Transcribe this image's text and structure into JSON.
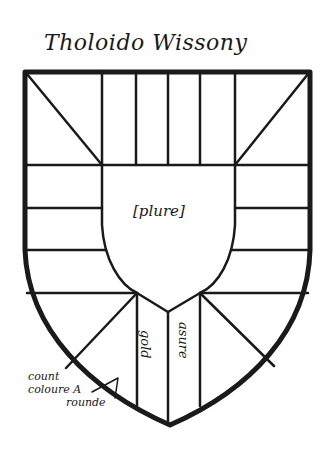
{
  "title": "Tholoido Wissony",
  "shield": {
    "center_label": "[plure]",
    "pale_left_label": "gold",
    "pale_right_label": "asure",
    "margin_note": [
      "count",
      "coloure A",
      "rounde"
    ]
  },
  "colors": {
    "ink": "#1a1a1a",
    "paper": "#ffffff"
  }
}
